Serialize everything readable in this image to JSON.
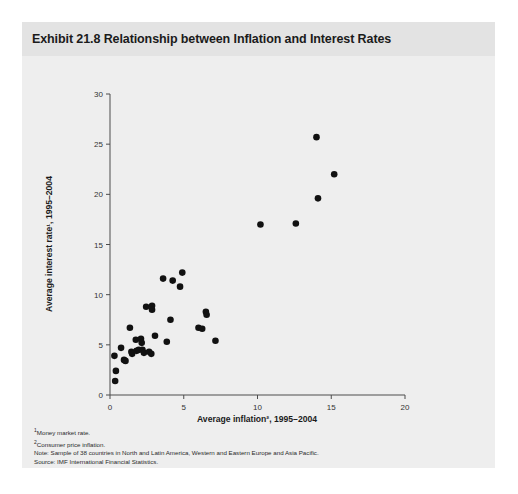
{
  "chart_title": "Exhibit 21.8 Relationship between Inflation and Interest Rates",
  "footnotes": [
    "Money market rate.",
    "Consumer price inflation.",
    "Note: Sample of 38 countries in North and Latin America, Western and Eastern Europe and Asia Pacific.",
    "Source: IMF International Financial Statistics."
  ],
  "footnote_markers": [
    "1",
    "2",
    "",
    ""
  ],
  "chart_data": {
    "type": "scatter",
    "title": "Exhibit 21.8 Relationship between Inflation and Interest Rates",
    "xlabel": "Average inflation², 1995–2004",
    "ylabel": "Average interest rate¹, 1995–2004",
    "xlim": [
      0,
      20
    ],
    "ylim": [
      0,
      30
    ],
    "xticks": [
      0,
      5,
      10,
      15,
      20
    ],
    "yticks": [
      0,
      5,
      10,
      15,
      20,
      25,
      30
    ],
    "xtick_labels": [
      "0",
      "5",
      "10",
      "15",
      "20"
    ],
    "ytick_labels": [
      "0",
      "5",
      "10",
      "15",
      "20",
      "25",
      "30"
    ],
    "grid": false,
    "legend": false,
    "marker_color": "#111111",
    "marker_size": 3.3,
    "n_points": 38,
    "points": [
      {
        "x": 0.35,
        "y": 1.4
      },
      {
        "x": 0.4,
        "y": 2.4
      },
      {
        "x": 0.3,
        "y": 3.9
      },
      {
        "x": 0.75,
        "y": 4.7
      },
      {
        "x": 0.95,
        "y": 3.5
      },
      {
        "x": 1.05,
        "y": 3.4
      },
      {
        "x": 1.35,
        "y": 6.7
      },
      {
        "x": 1.45,
        "y": 4.3
      },
      {
        "x": 1.5,
        "y": 4.1
      },
      {
        "x": 1.75,
        "y": 5.5
      },
      {
        "x": 1.8,
        "y": 4.4
      },
      {
        "x": 1.95,
        "y": 4.5
      },
      {
        "x": 2.1,
        "y": 5.6
      },
      {
        "x": 2.15,
        "y": 5.2
      },
      {
        "x": 2.2,
        "y": 4.5
      },
      {
        "x": 2.3,
        "y": 4.2
      },
      {
        "x": 2.45,
        "y": 8.8
      },
      {
        "x": 2.65,
        "y": 4.3
      },
      {
        "x": 2.8,
        "y": 4.1
      },
      {
        "x": 2.85,
        "y": 8.9
      },
      {
        "x": 2.85,
        "y": 8.5
      },
      {
        "x": 3.05,
        "y": 5.9
      },
      {
        "x": 3.6,
        "y": 11.6
      },
      {
        "x": 3.85,
        "y": 5.3
      },
      {
        "x": 4.1,
        "y": 7.5
      },
      {
        "x": 4.25,
        "y": 11.4
      },
      {
        "x": 4.9,
        "y": 12.2
      },
      {
        "x": 4.75,
        "y": 10.8
      },
      {
        "x": 6.0,
        "y": 6.7
      },
      {
        "x": 6.25,
        "y": 6.6
      },
      {
        "x": 6.5,
        "y": 8.3
      },
      {
        "x": 6.55,
        "y": 8.0
      },
      {
        "x": 7.15,
        "y": 5.4
      },
      {
        "x": 10.2,
        "y": 17.0
      },
      {
        "x": 12.6,
        "y": 17.1
      },
      {
        "x": 14.0,
        "y": 25.7
      },
      {
        "x": 14.1,
        "y": 19.6
      },
      {
        "x": 15.2,
        "y": 22.0
      }
    ]
  }
}
